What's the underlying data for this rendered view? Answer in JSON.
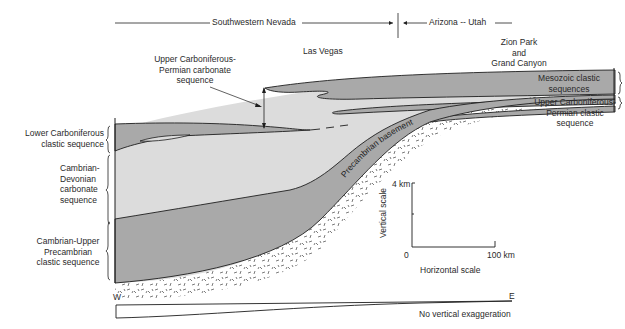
{
  "regions": {
    "southwestern_nevada": "Southwestern Nevada",
    "arizona_utah": "Arizona -- Utah"
  },
  "places": {
    "las_vegas": "Las Vegas",
    "zion_grand_canyon": [
      "Zion Park",
      "and",
      "Grand Canyon"
    ]
  },
  "left_labels": {
    "upper_carb_permian_carbonate": [
      "Upper Carboniferous-",
      "Permian carbonate",
      "sequence"
    ],
    "lower_carboniferous": [
      "Lower Carboniferous",
      "clastic sequence"
    ],
    "cambrian_devonian": [
      "Cambrian-",
      "Devonian",
      "carbonate",
      "sequence"
    ],
    "cambrian_upper_precambrian": [
      "Cambrian-Upper",
      "Precambrian",
      "clastic sequence"
    ]
  },
  "right_labels": {
    "mesozoic": [
      "Mesozoic clastic",
      "sequences"
    ],
    "upper_carb_permian_clastic": [
      "Upper Carboniferous-",
      "Permian clastic",
      "sequence"
    ]
  },
  "basement_label": "Precambrian basement",
  "scale": {
    "vertical_label": "Vertical scale",
    "vertical_max": "4 km",
    "origin": "0",
    "horizontal_max": "100 km",
    "horizontal_label": "Horizontal scale"
  },
  "profile": {
    "west": "W",
    "east": "E",
    "caption": "No vertical exaggeration"
  },
  "colors": {
    "light_gray": "#dcdcdc",
    "dark_gray": "#a9a9a9",
    "line": "#1e1e1e"
  }
}
